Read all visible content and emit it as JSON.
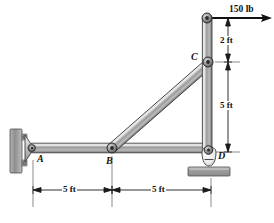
{
  "figure": {
    "background_color": "#ffffff",
    "line_color": "#1a1a1a",
    "member_color_light": "#e8e8e8",
    "member_color_mid": "#a8a8a8",
    "member_color_dark": "#6e6e6e",
    "support_color": "#9a9a9a"
  },
  "joints": [
    {
      "id": "A",
      "label": "A",
      "x": 30,
      "y": 148,
      "type": "pin-support-wall"
    },
    {
      "id": "B",
      "label": "B",
      "x": 112,
      "y": 148,
      "type": "pin"
    },
    {
      "id": "C",
      "label": "C",
      "x": 209,
      "y": 62,
      "type": "pin"
    },
    {
      "id": "D",
      "label": "D",
      "x": 209,
      "y": 152,
      "type": "rocker-support"
    },
    {
      "id": "E",
      "label": "",
      "x": 207,
      "y": 18,
      "type": "pin-top"
    }
  ],
  "members": [
    {
      "id": "AB",
      "from": "A",
      "to": "B"
    },
    {
      "id": "BD",
      "from": "B",
      "to": "D"
    },
    {
      "id": "BC",
      "from": "B",
      "to": "C"
    },
    {
      "id": "ED",
      "from": "E",
      "to": "D"
    }
  ],
  "load": {
    "label": "150 lb",
    "magnitude": 150,
    "unit": "lb",
    "direction": "horizontal-right",
    "applied_at": "E"
  },
  "dimensions": [
    {
      "id": "dim-ab",
      "label": "5 ft",
      "value": 5,
      "unit": "ft",
      "orientation": "horizontal",
      "from": "A",
      "to": "B"
    },
    {
      "id": "dim-bd",
      "label": "5 ft",
      "value": 5,
      "unit": "ft",
      "orientation": "horizontal",
      "from": "B",
      "to": "D"
    },
    {
      "id": "dim-ec",
      "label": "2 ft",
      "value": 2,
      "unit": "ft",
      "orientation": "vertical",
      "from": "E",
      "to": "C"
    },
    {
      "id": "dim-cd",
      "label": "5 ft",
      "value": 5,
      "unit": "ft",
      "orientation": "vertical",
      "from": "C",
      "to": "D"
    }
  ],
  "labels": {
    "A": "A",
    "B": "B",
    "C": "C",
    "D": "D",
    "load": "150 lb",
    "dim_ab": "5 ft",
    "dim_bd": "5 ft",
    "dim_ec": "2 ft",
    "dim_cd": "5 ft"
  }
}
